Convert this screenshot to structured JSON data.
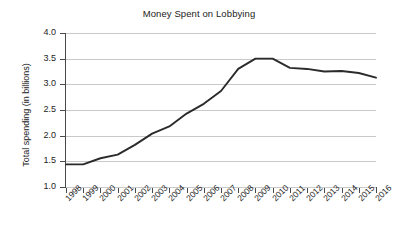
{
  "chart_data": {
    "type": "line",
    "title": "Money Spent on Lobbying",
    "xlabel": "",
    "ylabel": "Total spending (in billions)",
    "x": [
      1998,
      1999,
      2000,
      2001,
      2002,
      2003,
      2004,
      2005,
      2006,
      2007,
      2008,
      2009,
      2010,
      2011,
      2012,
      2013,
      2014,
      2015,
      2016
    ],
    "categories": [
      "1998",
      "1999",
      "2000",
      "2001",
      "2002",
      "2003",
      "2004",
      "2005",
      "2006",
      "2007",
      "2008",
      "2009",
      "2010",
      "2011",
      "2012",
      "2013",
      "2014",
      "2015",
      "2016"
    ],
    "values": [
      1.44,
      1.44,
      1.56,
      1.63,
      1.82,
      2.04,
      2.18,
      2.43,
      2.62,
      2.87,
      3.3,
      3.5,
      3.5,
      3.32,
      3.3,
      3.25,
      3.26,
      3.22,
      3.13
    ],
    "series": [
      {
        "name": "Total spending",
        "values": [
          1.44,
          1.44,
          1.56,
          1.63,
          1.82,
          2.04,
          2.18,
          2.43,
          2.62,
          2.87,
          3.3,
          3.5,
          3.5,
          3.32,
          3.3,
          3.25,
          3.26,
          3.22,
          3.13
        ]
      }
    ],
    "yticks": [
      "1.0",
      "1.5",
      "2.0",
      "2.5",
      "3.0",
      "3.5",
      "4.0"
    ],
    "ytick_values": [
      1.0,
      1.5,
      2.0,
      2.5,
      3.0,
      3.5,
      4.0
    ],
    "ylim": [
      1.0,
      4.0
    ],
    "xlim": [
      1998,
      2016
    ],
    "grid": true,
    "legend": false,
    "line_color": "#2b2b2b",
    "grid_color": "#c9c9c9",
    "axis_color": "#4a4a4a",
    "background_color": "#ffffff"
  }
}
